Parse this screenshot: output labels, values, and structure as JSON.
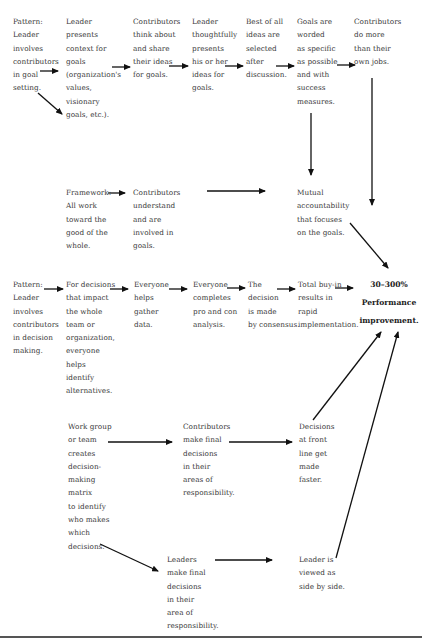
{
  "diagram": {
    "row1": {
      "pattern": "Pattern:\nLeader\ninvolves\ncontributors\nin goal\nsetting.",
      "steps": [
        "Leader\npresents\ncontext for\ngoals\n(organization's\nvalues,\nvisionary\ngoals, etc.).",
        "Contributors\nthink about\nand share\ntheir ideas\nfor goals.",
        "Leader\nthoughtfully\npresents\nhis or her\nideas for\ngoals.",
        "Best of all\nideas are\nselected\nafter\ndiscussion.",
        "Goals are\nworded\nas specific\nas possible\nand with\nsuccess\nmeasures.",
        "Contributors\ndo more\nthan their\nown jobs."
      ]
    },
    "framework": {
      "label": "Framework:\nAll work\ntoward the\ngood of the\nwhole.",
      "contributors": "Contributors\nunderstand\nand are\ninvolved in\ngoals.",
      "mutual": "Mutual\naccountability\nthat focuses\non the goals."
    },
    "row2": {
      "pattern": "Pattern:\nLeader\ninvolves\ncontributors\nin decision\nmaking.",
      "steps": [
        "For decisions\nthat impact\nthe whole\nteam or\norganization,\neveryone\nhelps\nidentify\nalternatives.",
        "Everyone\nhelps\ngather\ndata.",
        "Everyone\ncompletes\npro and con\nanalysis.",
        "The\ndecision\nis made\nby consensus.",
        "Total buy-in\nresults in\nrapid\nimplementation."
      ]
    },
    "result": "30–300%\nPerformance\nimprovement.",
    "row3": {
      "workgroup": "Work group\nor team\ncreates\ndecision-\nmaking\nmatrix\nto identify\nwho makes\nwhich\ndecisions.",
      "contributors_final": "Contributors\nmake final\ndecisions\nin their\nareas of\nresponsibility.",
      "front_line": "Decisions\nat front\nline get\nmade\nfaster.",
      "leaders_final": "Leaders\nmake final\ndecisions\nin their\narea of\nresponsibility.",
      "side_by_side": "Leader is\nviewed as\nside by side."
    }
  }
}
